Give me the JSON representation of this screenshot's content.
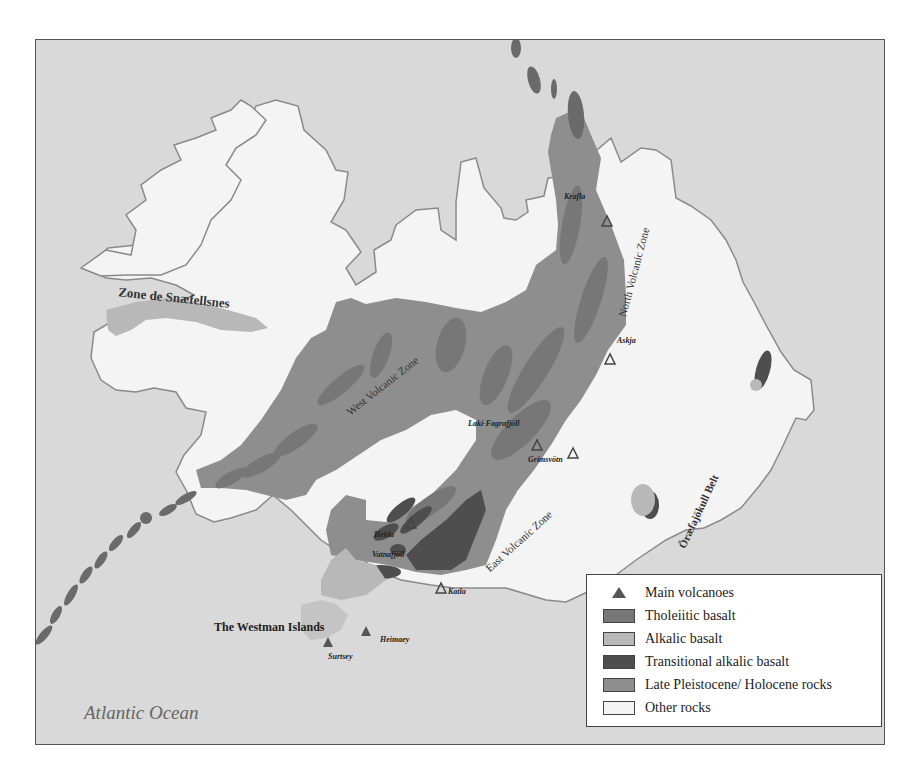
{
  "map": {
    "title": "Volcanic zones and rock types of Iceland",
    "colors": {
      "ocean": "#d9d9d9",
      "other_rocks": "#f4f4f4",
      "coastline": "#8a8a8a",
      "late_pleistocene_holocene": "#8e8e8e",
      "tholeiitic_basalt": "#777777",
      "alkalic_basalt": "#b8b8b8",
      "transitional_alkalic_basalt": "#4e4e4e",
      "volcano_marker": "#555555"
    },
    "ocean_label": "Atlantic Ocean",
    "region_labels": {
      "snaefellsnes": "Zone de Snæfellsnes",
      "west_zone": "West Volcanic Zone",
      "north_zone": "North Volcanic Zone",
      "east_zone": "East Volcanic Zone",
      "oraefa": "Öræfajökull Belt",
      "westman": "The Westman Islands"
    },
    "volcanoes": [
      {
        "name": "Krafla",
        "x": 571,
        "y": 176
      },
      {
        "name": "Askja",
        "x": 574,
        "y": 314
      },
      {
        "name": "Laki-Fagrafjöll",
        "x": 501,
        "y": 400
      },
      {
        "name": "Grímsvötn",
        "x": 537,
        "y": 408
      },
      {
        "name": "Hekla",
        "x": 360,
        "y": 492
      },
      {
        "name": "Vatnafjöll",
        "x": 375,
        "y": 505
      },
      {
        "name": "Katla",
        "x": 405,
        "y": 543
      },
      {
        "name": "Heimaey",
        "x": 330,
        "y": 592
      },
      {
        "name": "Surtsey",
        "x": 292,
        "y": 603
      }
    ]
  },
  "legend": {
    "items": [
      {
        "label": "Main volcanoes",
        "type": "triangle"
      },
      {
        "label": "Tholeiitic basalt",
        "type": "swatch",
        "color": "#777777"
      },
      {
        "label": "Alkalic basalt",
        "type": "swatch",
        "color": "#b8b8b8"
      },
      {
        "label": "Transitional alkalic basalt",
        "type": "swatch",
        "color": "#4e4e4e"
      },
      {
        "label": "Late Pleistocene/ Holocene rocks",
        "type": "swatch",
        "color": "#8e8e8e"
      },
      {
        "label": "Other rocks",
        "type": "swatch",
        "color": "#f4f4f4"
      }
    ]
  }
}
